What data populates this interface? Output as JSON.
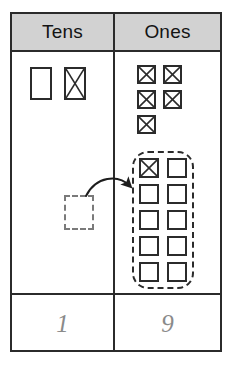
{
  "worksheet": {
    "type": "place-value-regrouping-chart",
    "columns": [
      {
        "key": "tens",
        "header": "Tens"
      },
      {
        "key": "ones",
        "header": "Ones"
      }
    ],
    "answers": {
      "tens": "1",
      "ones": "9"
    }
  },
  "tens_column": {
    "rods": [
      {
        "id": "rod-1",
        "crossed_out": false
      },
      {
        "id": "rod-2",
        "crossed_out": true
      }
    ],
    "placeholder": {
      "id": "rod-placeholder",
      "style": "dashed-outline",
      "crossed_out": false
    }
  },
  "ones_column": {
    "loose_units": [
      {
        "id": "unit-1",
        "crossed_out": true
      },
      {
        "id": "unit-2",
        "crossed_out": true
      },
      {
        "id": "unit-3",
        "crossed_out": true
      },
      {
        "id": "unit-4",
        "crossed_out": true
      },
      {
        "id": "unit-5",
        "crossed_out": true
      }
    ],
    "regrouped_group": {
      "count": 10,
      "ring_style": "dashed-rounded",
      "units": [
        {
          "id": "grouped-1",
          "crossed_out": true
        },
        {
          "id": "grouped-2",
          "crossed_out": false
        },
        {
          "id": "grouped-3",
          "crossed_out": false
        },
        {
          "id": "grouped-4",
          "crossed_out": false
        },
        {
          "id": "grouped-5",
          "crossed_out": false
        },
        {
          "id": "grouped-6",
          "crossed_out": false
        },
        {
          "id": "grouped-7",
          "crossed_out": false
        },
        {
          "id": "grouped-8",
          "crossed_out": false
        },
        {
          "id": "grouped-9",
          "crossed_out": false
        },
        {
          "id": "grouped-10",
          "crossed_out": false
        }
      ]
    }
  },
  "annotation": {
    "arrow": {
      "label": "regroup-arrow",
      "direction": "tens-to-ones",
      "style": "curved-solid"
    }
  },
  "colors": {
    "ink": "#2b2b2b",
    "header_fill": "#d2d2d2",
    "answer_text": "#8a8a8a",
    "dashed_gray": "#7a7a7a",
    "paper": "#ffffff"
  }
}
